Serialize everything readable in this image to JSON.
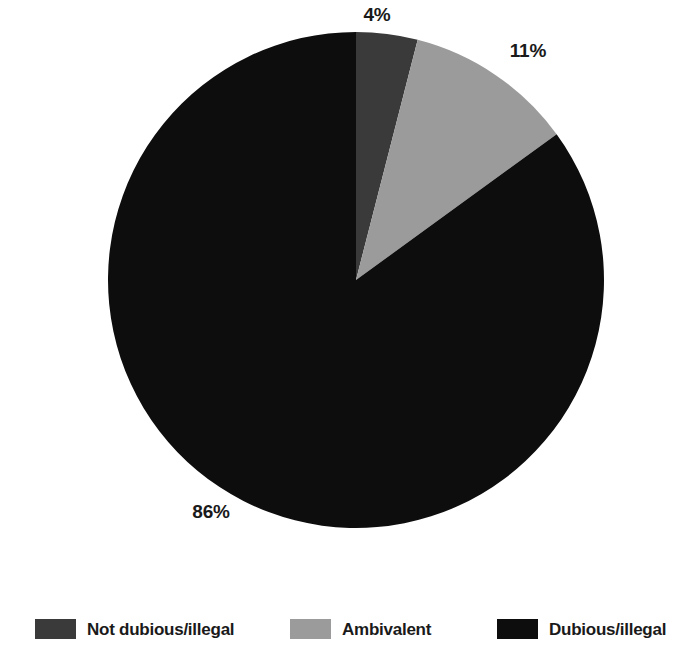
{
  "chart_data": {
    "type": "pie",
    "title": "",
    "subtitle": "",
    "xlabel": "",
    "ylabel": "",
    "legend_position": "bottom",
    "grid": false,
    "categories": [
      "Not dubious/illegal",
      "Ambivalent",
      "Dubious/illegal"
    ],
    "values": [
      4,
      11,
      86
    ],
    "value_labels": [
      "4%",
      "11%",
      "86%"
    ],
    "colors": [
      "#3a3a3a",
      "#9b9b9b",
      "#0d0d0d"
    ],
    "start_angle_deg": 0,
    "direction": "clockwise",
    "slices": [
      {
        "name": "Not dubious/illegal",
        "value": 4,
        "label": "4%",
        "color": "#3a3a3a",
        "start_deg": 0,
        "end_deg": 14.4
      },
      {
        "name": "Ambivalent",
        "value": 11,
        "label": "11%",
        "color": "#9b9b9b",
        "start_deg": 14.4,
        "end_deg": 54.0
      },
      {
        "name": "Dubious/illegal",
        "value": 86,
        "label": "86%",
        "color": "#0d0d0d",
        "start_deg": 54.0,
        "end_deg": 360
      }
    ]
  },
  "labels": {
    "not_dubious": "4%",
    "ambivalent": "11%",
    "dubious": "86%"
  },
  "legend": {
    "items": [
      {
        "label": "Not dubious/illegal",
        "color": "#3a3a3a"
      },
      {
        "label": "Ambivalent",
        "color": "#9b9b9b"
      },
      {
        "label": "Dubious/illegal",
        "color": "#0d0d0d"
      }
    ]
  }
}
